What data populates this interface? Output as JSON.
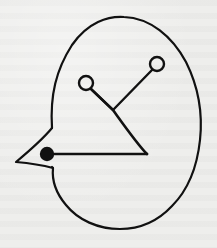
{
  "figure": {
    "canvas": {
      "width": 217,
      "height": 248
    },
    "colors": {
      "background": "#eeeeec",
      "ink": "#111111"
    },
    "outline": {
      "stroke_width": 2.2,
      "path": "M 52 128 C 50 95, 56 70, 72 45 C 88 22, 108 16, 124 17 C 150 18, 172 36, 186 62 C 198 86, 203 112, 200 140 C 197 168, 188 190, 172 206 C 158 221, 140 229, 120 229 C 98 229, 78 220, 66 205 C 55 192, 52 178, 53 168 L 52 167"
    },
    "beak": {
      "stroke_width": 2.2,
      "path": "M 52 128 C 42 140, 28 152, 16 162 C 28 163, 42 165, 53 168"
    },
    "eye": {
      "cx": 47,
      "cy": 154,
      "r": 7.2
    },
    "triangle": {
      "stroke_width": 2.6,
      "base": {
        "x1": 47,
        "y1": 154,
        "x2": 147,
        "y2": 154
      },
      "side_path": "M 147 154 C 138 145, 126 128, 113 110 L 91 89"
    },
    "stalks": {
      "stroke_width": 2.4,
      "left": {
        "circle": {
          "cx": 86,
          "cy": 83,
          "r": 7
        },
        "line": {
          "x1": 91,
          "y1": 89,
          "x2": 113,
          "y2": 110
        }
      },
      "right": {
        "circle": {
          "cx": 157,
          "cy": 64,
          "r": 7
        },
        "line": {
          "x1": 152,
          "y1": 70,
          "x2": 113,
          "y2": 110
        }
      }
    }
  }
}
